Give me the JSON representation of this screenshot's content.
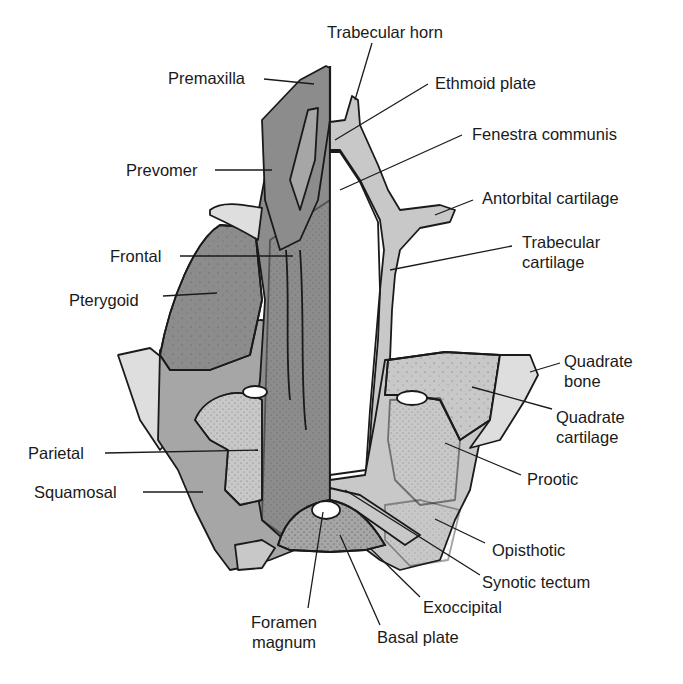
{
  "figure": {
    "colors": {
      "dermal_dark": "#8c8c8c",
      "dermal_mid": "#a6a6a6",
      "cartilage_light": "#c8c8c8",
      "cartilage_pale": "#dedede",
      "outline": "#1a1a1a",
      "background": "#ffffff"
    },
    "labels_left": [
      {
        "id": "premaxilla",
        "text": "Premaxilla"
      },
      {
        "id": "prevomer",
        "text": "Prevomer"
      },
      {
        "id": "frontal",
        "text": "Frontal"
      },
      {
        "id": "pterygoid",
        "text": "Pterygoid"
      },
      {
        "id": "parietal",
        "text": "Parietal"
      },
      {
        "id": "squamosal",
        "text": "Squamosal"
      }
    ],
    "labels_right": [
      {
        "id": "trabecular-horn",
        "text": "Trabecular horn"
      },
      {
        "id": "ethmoid-plate",
        "text": "Ethmoid plate"
      },
      {
        "id": "fenestra-communis",
        "text": "Fenestra communis"
      },
      {
        "id": "antorbital-cartilage",
        "text": "Antorbital cartilage"
      },
      {
        "id": "trabecular-cartilage",
        "line1": "Trabecular",
        "line2": "cartilage"
      },
      {
        "id": "quadrate-bone",
        "line1": "Quadrate",
        "line2": "bone"
      },
      {
        "id": "quadrate-cartilage",
        "line1": "Quadrate",
        "line2": "cartilage"
      },
      {
        "id": "prootic",
        "text": "Prootic"
      },
      {
        "id": "opisthotic",
        "text": "Opisthotic"
      },
      {
        "id": "synotic-tectum",
        "text": "Synotic tectum"
      },
      {
        "id": "exoccipital",
        "text": "Exoccipital"
      }
    ],
    "labels_bottom": [
      {
        "id": "foramen-magnum",
        "line1": "Foramen",
        "line2": "magnum"
      },
      {
        "id": "basal-plate",
        "text": "Basal plate"
      }
    ]
  }
}
